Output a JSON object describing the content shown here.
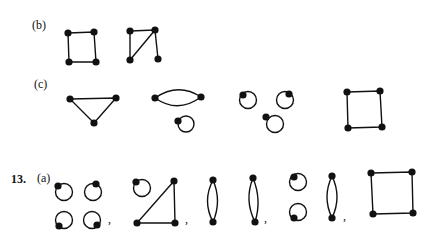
{
  "parts": {
    "b": {
      "label": "(b)"
    },
    "c": {
      "label": "(c)"
    },
    "problem13": {
      "number": "13.",
      "a_label": "(a)"
    }
  },
  "separators": [
    ",",
    ",",
    ",",
    ","
  ],
  "graphs": {
    "b": [
      {
        "name": "square-cycle-c4",
        "vertices": 4,
        "edges": 4
      },
      {
        "name": "triangle-with-pendant",
        "vertices": 4,
        "edges": 4
      }
    ],
    "c": [
      {
        "name": "triangle-k3",
        "vertices": 3,
        "edges": 3
      },
      {
        "name": "digon-plus-loop",
        "vertices": 3,
        "edges": 3
      },
      {
        "name": "three-loops",
        "vertices": 3,
        "edges": 3
      },
      {
        "name": "square-cycle-c4",
        "vertices": 4,
        "edges": 4
      }
    ],
    "13a": [
      {
        "name": "four-loops",
        "vertices": 4,
        "edges": 4
      },
      {
        "name": "loop-plus-triangle",
        "vertices": 4,
        "edges": 4
      },
      {
        "name": "two-digons",
        "vertices": 4,
        "edges": 4
      },
      {
        "name": "two-loops-plus-digon",
        "vertices": 4,
        "edges": 4
      },
      {
        "name": "square-cycle-c4",
        "vertices": 4,
        "edges": 4
      }
    ]
  },
  "colors": {
    "ink": "#111111",
    "paper": "#ffffff"
  }
}
